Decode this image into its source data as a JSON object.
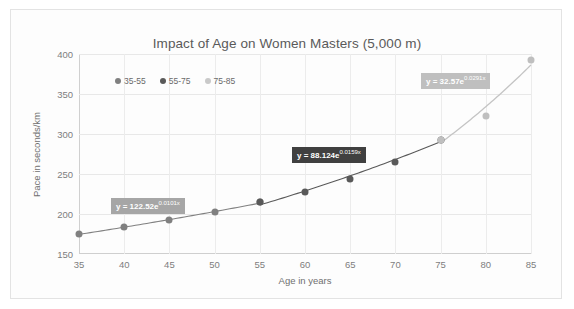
{
  "chart_data": {
    "type": "scatter",
    "title": "Impact of Age on Women Masters (5,000 m)",
    "xlabel": "Age in years",
    "ylabel": "Pace in seconds/km",
    "xlim": [
      35,
      85
    ],
    "ylim": [
      150,
      400
    ],
    "xticks": [
      "35",
      "40",
      "45",
      "50",
      "55",
      "60",
      "65",
      "70",
      "75",
      "80",
      "85"
    ],
    "yticks": [
      "150",
      "200",
      "250",
      "300",
      "350",
      "400"
    ],
    "grid": true,
    "legend_position": "inside-top-left",
    "x": [
      35,
      40,
      45,
      50,
      55,
      60,
      65,
      70,
      75,
      80,
      85
    ],
    "series": [
      {
        "name": "35-55",
        "color": "#808080",
        "x": [
          35,
          40,
          45,
          50,
          55
        ],
        "values": [
          175,
          184,
          192,
          203,
          215
        ]
      },
      {
        "name": "55-75",
        "color": "#595959",
        "x": [
          55,
          60,
          65,
          70,
          75
        ],
        "values": [
          215,
          227,
          244,
          265,
          293
        ]
      },
      {
        "name": "75-85",
        "color": "#bfbfbf",
        "x": [
          75,
          80,
          85
        ],
        "values": [
          293,
          323,
          393
        ]
      }
    ],
    "trendlines": [
      {
        "series": "35-55",
        "label_prefix": "y = 122.52e",
        "label_exponent": "0.0101x",
        "coefficient": 122.52,
        "rate": 0.0101,
        "box_color": "#a6a6a6"
      },
      {
        "series": "55-75",
        "label_prefix": "y = 88.124e",
        "label_exponent": "0.0159x",
        "coefficient": 88.124,
        "rate": 0.0159,
        "box_color": "#404040"
      },
      {
        "series": "75-85",
        "label_prefix": "y = 32.57e",
        "label_exponent": "0.0291x",
        "coefficient": 32.57,
        "rate": 0.0291,
        "box_color": "#bfbfbf"
      }
    ],
    "annotations": [
      "y = 122.52e0.0101x",
      "y = 88.124e0.0159x",
      "y = 32.57e0.0291x"
    ]
  }
}
